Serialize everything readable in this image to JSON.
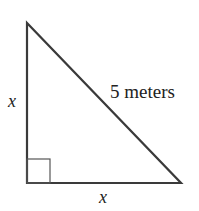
{
  "diagram": {
    "type": "right-triangle",
    "labels": {
      "left_leg": "x",
      "bottom_leg": "x",
      "hypotenuse": "5 meters"
    },
    "colors": {
      "stroke": "#3a3a3a",
      "text": "#222222",
      "background": "#ffffff"
    }
  }
}
